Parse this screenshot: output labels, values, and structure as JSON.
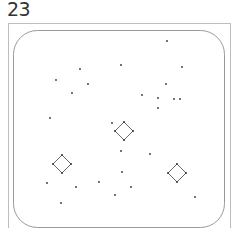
{
  "title": "23",
  "colors": {
    "frame": "#bdbdbd",
    "rounded_rect": "#9a9a9a",
    "dot": "#333333",
    "diamond_stroke": "#444444"
  },
  "frame": {
    "x": 8,
    "y": 23,
    "w": 222,
    "h": 210
  },
  "rounded_rect": {
    "x": 13,
    "y": 30,
    "w": 211,
    "h": 197,
    "r": 24
  },
  "dots": [
    {
      "x": 167,
      "y": 41
    },
    {
      "x": 121,
      "y": 65
    },
    {
      "x": 182,
      "y": 67
    },
    {
      "x": 80,
      "y": 69
    },
    {
      "x": 56,
      "y": 80
    },
    {
      "x": 88,
      "y": 84
    },
    {
      "x": 166,
      "y": 84
    },
    {
      "x": 72,
      "y": 93
    },
    {
      "x": 142,
      "y": 95
    },
    {
      "x": 158,
      "y": 98
    },
    {
      "x": 174,
      "y": 99
    },
    {
      "x": 180,
      "y": 99
    },
    {
      "x": 158,
      "y": 108
    },
    {
      "x": 50,
      "y": 118
    },
    {
      "x": 112,
      "y": 123
    },
    {
      "x": 121,
      "y": 151
    },
    {
      "x": 150,
      "y": 154
    },
    {
      "x": 122,
      "y": 172
    },
    {
      "x": 47,
      "y": 183
    },
    {
      "x": 99,
      "y": 182
    },
    {
      "x": 76,
      "y": 187
    },
    {
      "x": 131,
      "y": 187
    },
    {
      "x": 115,
      "y": 195
    },
    {
      "x": 195,
      "y": 197
    },
    {
      "x": 61,
      "y": 203
    }
  ],
  "diamonds": [
    {
      "name": "center",
      "cx": 124,
      "cy": 131,
      "r": 9
    },
    {
      "name": "left",
      "cx": 62,
      "cy": 164,
      "r": 9
    },
    {
      "name": "right",
      "cx": 177,
      "cy": 173,
      "r": 9
    }
  ]
}
